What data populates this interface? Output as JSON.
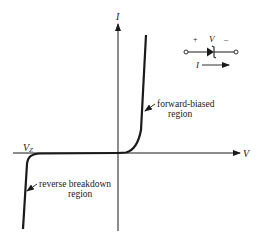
{
  "diagram": {
    "type": "zener-diode-iv-characteristic",
    "axes": {
      "x_label": "V",
      "y_label": "I"
    },
    "annotations": {
      "breakdown_voltage": "V",
      "breakdown_voltage_sub": "Z",
      "forward_region_line1": "forward-biased",
      "forward_region_line2": "region",
      "reverse_region_line1": "reverse breakdown",
      "reverse_region_line2": "region"
    },
    "symbol": {
      "plus": "+",
      "voltage": "V",
      "minus": "–",
      "current": "I"
    },
    "colors": {
      "ink": "#1a1a1a",
      "background": "#ffffff"
    }
  }
}
